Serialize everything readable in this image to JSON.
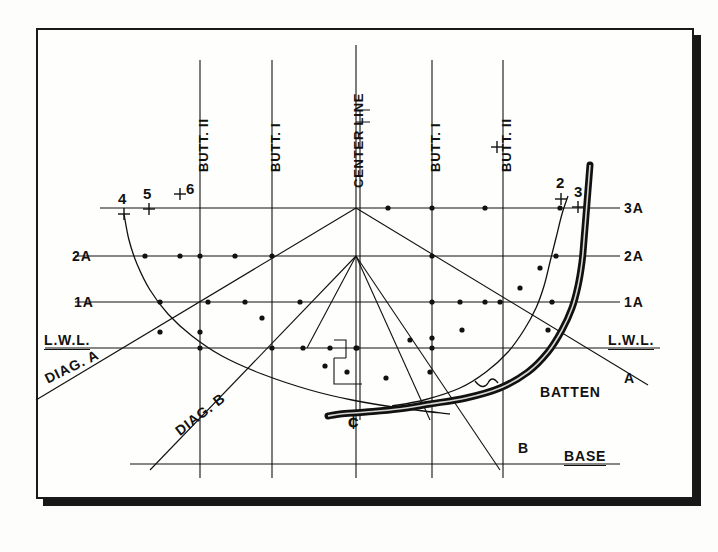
{
  "drawing": {
    "title": "Body Plan Lines Drawing with Batten",
    "type": "naval-architecture-lines-plan",
    "ink_color": "#111111",
    "paper_color": "#fefefd",
    "frame_shadow_color": "#181818"
  },
  "vertical_labels": [
    {
      "id": "butt2-left",
      "text": "BUTT. II",
      "x": 200,
      "underline": true
    },
    {
      "id": "butt1-left",
      "text": "BUTT. I",
      "x": 272,
      "underline": true
    },
    {
      "id": "center-line",
      "text": "CENTER LINE",
      "x": 356,
      "underline": false
    },
    {
      "id": "butt1-right",
      "text": "BUTT. I",
      "x": 432,
      "underline": true
    },
    {
      "id": "butt2-right",
      "text": "BUTT. II",
      "x": 503,
      "underline": true
    }
  ],
  "waterline_labels_left": [
    {
      "id": "wl-2a",
      "text": "2A",
      "y": 256,
      "underline": false
    },
    {
      "id": "wl-1a",
      "text": "1A",
      "y": 302,
      "underline": false
    },
    {
      "id": "wl-lwl",
      "text": "L.W.L.",
      "y": 348,
      "underline": true
    }
  ],
  "waterline_labels_right": [
    {
      "id": "wl-3a-r",
      "text": "3A",
      "y": 208,
      "underline": false
    },
    {
      "id": "wl-2a-r",
      "text": "2A",
      "y": 256,
      "underline": false
    },
    {
      "id": "wl-1a-r",
      "text": "1A",
      "y": 302,
      "underline": false
    },
    {
      "id": "wl-lwl-r",
      "text": "L.W.L.",
      "y": 348,
      "underline": true
    }
  ],
  "diagonal_labels": [
    {
      "id": "diag-a",
      "text": "DIAG. A",
      "x": 42,
      "y": 378,
      "angle": -26
    },
    {
      "id": "diag-b",
      "text": "DIAG. B",
      "x": 172,
      "y": 432,
      "angle": -38
    },
    {
      "id": "diag-a-end",
      "text": "A",
      "x": 626,
      "y": 379,
      "angle": 0
    },
    {
      "id": "diag-b-end",
      "text": "B",
      "x": 521,
      "y": 448,
      "angle": 0
    }
  ],
  "base_label": {
    "text": "BASE",
    "x": 566,
    "y": 456,
    "underline": true
  },
  "batten_label": {
    "text": "BATTEN",
    "x": 542,
    "y": 392
  },
  "centerline_symbol": {
    "text": "¢",
    "x": 352,
    "y": 424
  },
  "station_marks": [
    {
      "label": "4",
      "x": 124,
      "y": 202,
      "mark_x": 124,
      "mark_y": 214
    },
    {
      "label": "5",
      "x": 148,
      "y": 197,
      "mark_x": 149,
      "mark_y": 209
    },
    {
      "label": "6",
      "x": 191,
      "y": 192,
      "mark_x": 180,
      "mark_y": 194
    },
    {
      "label": "1",
      "x": 497,
      "y": 126,
      "mark_x": 497,
      "mark_y": 147
    },
    {
      "label": "2",
      "x": 561,
      "y": 186,
      "mark_x": 561,
      "mark_y": 199
    },
    {
      "label": "3",
      "x": 578,
      "y": 194,
      "mark_x": 578,
      "mark_y": 207
    }
  ],
  "chart_data": {
    "type": "line",
    "xlabel": "Half-breadth (buttock stations)",
    "ylabel": "Height above baseline (waterlines)",
    "xlim": [
      40,
      690
    ],
    "ylim": [
      495,
      28
    ],
    "grid": true,
    "legend": "none",
    "waterlines": [
      {
        "name": "3A",
        "y": 208,
        "x_start": 100,
        "x_end": 620
      },
      {
        "name": "2A",
        "y": 256,
        "x_start": 75,
        "x_end": 620
      },
      {
        "name": "1A",
        "y": 302,
        "x_start": 75,
        "x_end": 620
      },
      {
        "name": "L.W.L.",
        "y": 348,
        "x_start": 45,
        "x_end": 660
      },
      {
        "name": "BASE",
        "y": 464,
        "x_start": 130,
        "x_end": 620
      }
    ],
    "buttocks": [
      {
        "name": "BUTT. II left",
        "x": 200,
        "y_top": 60,
        "y_bottom": 478
      },
      {
        "name": "BUTT. I left",
        "x": 272,
        "y_top": 60,
        "y_bottom": 478
      },
      {
        "name": "CENTER LINE",
        "x": 356,
        "y_top": 45,
        "y_bottom": 478
      },
      {
        "name": "BUTT. I right",
        "x": 432,
        "y_top": 60,
        "y_bottom": 478
      },
      {
        "name": "BUTT. II right",
        "x": 503,
        "y_top": 60,
        "y_bottom": 478
      }
    ],
    "diagonals": [
      {
        "name": "DIAG. A",
        "x1": 36,
        "y1": 400,
        "x2": 356,
        "y2": 208
      },
      {
        "name": "DIAG. A right",
        "x1": 356,
        "y1": 208,
        "x2": 648,
        "y2": 385
      },
      {
        "name": "DIAG. B",
        "x1": 150,
        "y1": 470,
        "x2": 356,
        "y2": 256
      },
      {
        "name": "DIAG. B right",
        "x1": 356,
        "y1": 256,
        "x2": 500,
        "y2": 470
      },
      {
        "name": "DIAG. C left",
        "x1": 307,
        "y1": 348,
        "x2": 356,
        "y2": 256
      },
      {
        "name": "DIAG. C right",
        "x1": 356,
        "y1": 256,
        "x2": 430,
        "y2": 420
      }
    ],
    "station_curve_left": {
      "name": "station 4 (left body)",
      "points": [
        [
          124,
          214
        ],
        [
          129,
          240
        ],
        [
          137,
          264
        ],
        [
          150,
          290
        ],
        [
          168,
          314
        ],
        [
          192,
          336
        ],
        [
          222,
          356
        ],
        [
          262,
          374
        ],
        [
          310,
          390
        ],
        [
          352,
          400
        ],
        [
          400,
          408
        ],
        [
          450,
          414
        ]
      ]
    },
    "station_curve_right": {
      "name": "station 2-3 (right body)",
      "points": [
        [
          568,
          196
        ],
        [
          562,
          214
        ],
        [
          556,
          238
        ],
        [
          550,
          262
        ],
        [
          544,
          286
        ],
        [
          536,
          308
        ],
        [
          524,
          330
        ],
        [
          508,
          352
        ],
        [
          486,
          372
        ],
        [
          460,
          388
        ],
        [
          424,
          400
        ],
        [
          392,
          406
        ]
      ]
    },
    "batten_curve": {
      "name": "BATTEN",
      "color": "#111111",
      "thickness": 7,
      "points": [
        [
          590,
          165
        ],
        [
          588,
          190
        ],
        [
          586,
          215
        ],
        [
          584,
          240
        ],
        [
          582,
          262
        ],
        [
          578,
          286
        ],
        [
          572,
          308
        ],
        [
          562,
          330
        ],
        [
          548,
          352
        ],
        [
          528,
          372
        ],
        [
          500,
          388
        ],
        [
          466,
          398
        ],
        [
          430,
          404
        ],
        [
          398,
          409
        ],
        [
          366,
          412
        ],
        [
          340,
          414
        ],
        [
          328,
          416
        ]
      ]
    },
    "data_point_markers": [
      [
        200,
        256
      ],
      [
        235,
        256
      ],
      [
        272,
        256
      ],
      [
        485,
        208
      ],
      [
        432,
        256
      ],
      [
        432,
        302
      ],
      [
        460,
        302
      ],
      [
        485,
        302
      ],
      [
        200,
        348
      ],
      [
        272,
        348
      ],
      [
        356,
        348
      ],
      [
        432,
        348
      ],
      [
        160,
        302
      ],
      [
        208,
        302
      ],
      [
        245,
        302
      ],
      [
        145,
        256
      ],
      [
        180,
        256
      ],
      [
        160,
        332
      ],
      [
        200,
        332
      ],
      [
        262,
        318
      ],
      [
        300,
        302
      ],
      [
        388,
        208
      ],
      [
        432,
        208
      ],
      [
        500,
        302
      ],
      [
        520,
        288
      ],
      [
        540,
        268
      ],
      [
        462,
        330
      ],
      [
        432,
        338
      ],
      [
        303,
        348
      ],
      [
        330,
        348
      ],
      [
        357,
        348
      ],
      [
        410,
        340
      ],
      [
        386,
        378
      ],
      [
        430,
        372
      ],
      [
        325,
        366
      ],
      [
        347,
        372
      ],
      [
        560,
        208
      ],
      [
        556,
        256
      ],
      [
        552,
        302
      ],
      [
        548,
        330
      ]
    ]
  }
}
